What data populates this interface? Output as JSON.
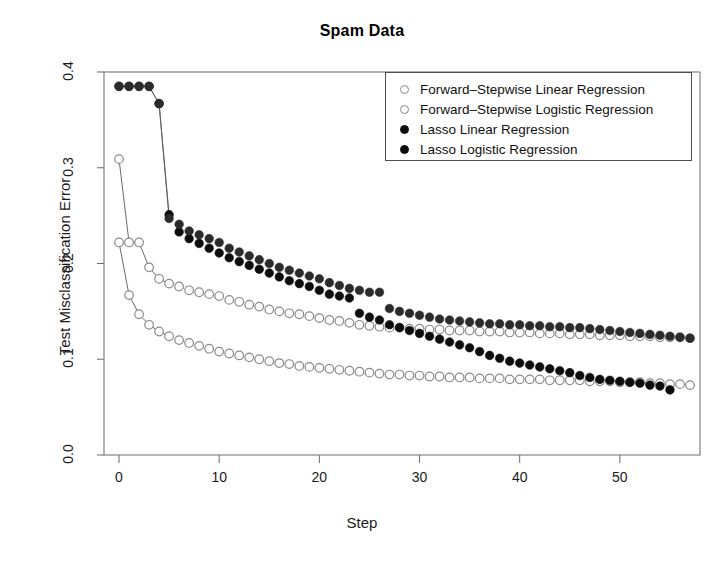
{
  "chart_data": {
    "type": "scatter",
    "title": "Spam Data",
    "xlabel": "Step",
    "ylabel": "Test Misclassification Error",
    "xlim": [
      -1.5,
      58
    ],
    "ylim": [
      0.0,
      0.4
    ],
    "xticks": [
      0,
      10,
      20,
      30,
      40,
      50
    ],
    "yticks": [
      "0.0",
      "0.1",
      "0.2",
      "0.3",
      "0.4"
    ],
    "grid": false,
    "legend_position": "top-right",
    "series": [
      {
        "name": "Forward-Stepwise Linear Regression",
        "marker": "open-circle",
        "color": "#8a8a8a",
        "x": [
          0,
          1,
          2,
          3,
          4,
          5,
          6,
          7,
          8,
          9,
          10,
          11,
          12,
          13,
          14,
          15,
          16,
          17,
          18,
          19,
          20,
          21,
          22,
          23,
          24,
          25,
          26,
          27,
          28,
          29,
          30,
          31,
          32,
          33,
          34,
          35,
          36,
          37,
          38,
          39,
          40,
          41,
          42,
          43,
          44,
          45,
          46,
          47,
          48,
          49,
          50,
          51,
          52,
          53,
          54,
          55,
          56,
          57
        ],
        "y": [
          0.309,
          0.222,
          0.222,
          0.196,
          0.184,
          0.179,
          0.176,
          0.172,
          0.17,
          0.168,
          0.166,
          0.162,
          0.16,
          0.157,
          0.155,
          0.152,
          0.15,
          0.148,
          0.147,
          0.145,
          0.143,
          0.141,
          0.14,
          0.138,
          0.136,
          0.135,
          0.134,
          0.133,
          0.133,
          0.132,
          0.132,
          0.131,
          0.131,
          0.13,
          0.13,
          0.13,
          0.129,
          0.129,
          0.129,
          0.128,
          0.128,
          0.128,
          0.127,
          0.127,
          0.127,
          0.126,
          0.126,
          0.126,
          0.125,
          0.125,
          0.125,
          0.124,
          0.124,
          0.124,
          0.123,
          0.123,
          0.123,
          0.122
        ]
      },
      {
        "name": "Forward-Stepwise Logistic Regression",
        "marker": "open-circle",
        "color": "#8a8a8a",
        "x": [
          0,
          1,
          2,
          3,
          4,
          5,
          6,
          7,
          8,
          9,
          10,
          11,
          12,
          13,
          14,
          15,
          16,
          17,
          18,
          19,
          20,
          21,
          22,
          23,
          24,
          25,
          26,
          27,
          28,
          29,
          30,
          31,
          32,
          33,
          34,
          35,
          36,
          37,
          38,
          39,
          40,
          41,
          42,
          43,
          44,
          45,
          46,
          47,
          48,
          49,
          50,
          51,
          52,
          53,
          54,
          55,
          56,
          57
        ],
        "y": [
          0.222,
          0.167,
          0.147,
          0.136,
          0.129,
          0.124,
          0.12,
          0.117,
          0.114,
          0.111,
          0.108,
          0.106,
          0.104,
          0.102,
          0.1,
          0.098,
          0.096,
          0.095,
          0.093,
          0.092,
          0.091,
          0.09,
          0.089,
          0.088,
          0.087,
          0.086,
          0.085,
          0.084,
          0.084,
          0.083,
          0.083,
          0.082,
          0.082,
          0.081,
          0.081,
          0.081,
          0.08,
          0.08,
          0.08,
          0.079,
          0.079,
          0.079,
          0.079,
          0.078,
          0.078,
          0.078,
          0.078,
          0.077,
          0.077,
          0.077,
          0.076,
          0.076,
          0.076,
          0.075,
          0.075,
          0.074,
          0.074,
          0.073
        ]
      },
      {
        "name": "Lasso Linear Regression",
        "marker": "filled-circle",
        "color": "#0d0d0d",
        "x": [
          0,
          1,
          2,
          3,
          4,
          5,
          6,
          7,
          8,
          9,
          10,
          11,
          12,
          13,
          14,
          15,
          16,
          17,
          18,
          19,
          20,
          21,
          22,
          23,
          24,
          25,
          26,
          27,
          28,
          29,
          30,
          31,
          32,
          33,
          34,
          35,
          36,
          37,
          38,
          39,
          40,
          41,
          42,
          43,
          44,
          45,
          46,
          47,
          48,
          49,
          50,
          51,
          52,
          53,
          54,
          55
        ],
        "y": [
          0.385,
          0.385,
          0.385,
          0.385,
          0.367,
          0.251,
          0.233,
          0.226,
          0.221,
          0.216,
          0.211,
          0.206,
          0.202,
          0.198,
          0.194,
          0.19,
          0.186,
          0.182,
          0.179,
          0.176,
          0.172,
          0.168,
          0.166,
          0.164,
          0.148,
          0.144,
          0.141,
          0.136,
          0.133,
          0.13,
          0.127,
          0.124,
          0.121,
          0.118,
          0.115,
          0.112,
          0.108,
          0.104,
          0.101,
          0.098,
          0.096,
          0.094,
          0.092,
          0.09,
          0.088,
          0.086,
          0.083,
          0.081,
          0.079,
          0.078,
          0.077,
          0.076,
          0.075,
          0.073,
          0.072,
          0.068
        ]
      },
      {
        "name": "Lasso Logistic Regression",
        "marker": "filled-circle",
        "color": "#2b2b2b",
        "x": [
          0,
          1,
          2,
          3,
          4,
          5,
          6,
          7,
          8,
          9,
          10,
          11,
          12,
          13,
          14,
          15,
          16,
          17,
          18,
          19,
          20,
          21,
          22,
          23,
          24,
          25,
          26,
          27,
          28,
          29,
          30,
          31,
          32,
          33,
          34,
          35,
          36,
          37,
          38,
          39,
          40,
          41,
          42,
          43,
          44,
          45,
          46,
          47,
          48,
          49,
          50,
          51,
          52,
          53,
          54,
          55,
          56,
          57
        ],
        "y": [
          0.385,
          0.385,
          0.385,
          0.385,
          0.367,
          0.247,
          0.241,
          0.234,
          0.23,
          0.226,
          0.222,
          0.216,
          0.212,
          0.208,
          0.204,
          0.2,
          0.196,
          0.193,
          0.19,
          0.187,
          0.184,
          0.18,
          0.177,
          0.174,
          0.172,
          0.17,
          0.17,
          0.153,
          0.15,
          0.148,
          0.146,
          0.144,
          0.142,
          0.141,
          0.14,
          0.139,
          0.138,
          0.137,
          0.137,
          0.136,
          0.136,
          0.135,
          0.135,
          0.134,
          0.134,
          0.133,
          0.133,
          0.132,
          0.131,
          0.13,
          0.129,
          0.128,
          0.127,
          0.126,
          0.125,
          0.124,
          0.123,
          0.122
        ]
      }
    ],
    "legend": [
      {
        "label": "Forward-Stepwise Linear Regression",
        "marker": "open-circle"
      },
      {
        "label": "Forward-Stepwise Logistic Regression",
        "marker": "open-circle"
      },
      {
        "label": "Lasso Linear Regression",
        "marker": "filled-circle"
      },
      {
        "label": "Lasso Logistic Regression",
        "marker": "filled-circle"
      }
    ]
  }
}
